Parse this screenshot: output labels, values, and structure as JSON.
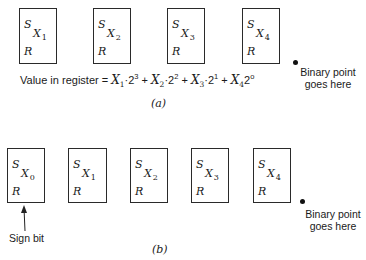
{
  "part_a": {
    "registers": [
      {
        "s": "S",
        "x": "X",
        "sub": "1",
        "r": "R"
      },
      {
        "s": "S",
        "x": "X",
        "sub": "2",
        "r": "R"
      },
      {
        "s": "S",
        "x": "X",
        "sub": "3",
        "r": "R"
      },
      {
        "s": "S",
        "x": "X",
        "sub": "4",
        "r": "R"
      }
    ],
    "equation": {
      "prefix": "Value in register = ",
      "terms": [
        {
          "var": "X",
          "sub": "1",
          "op": "·",
          "base": "2",
          "exp": "3"
        },
        {
          "var": "X",
          "sub": "2",
          "op": "·",
          "base": "2",
          "exp": "2"
        },
        {
          "var": "X",
          "sub": "3",
          "op": "·",
          "base": "2",
          "exp": "1"
        },
        {
          "var": "X",
          "sub": "4",
          "op": "",
          "base": "2",
          "exp": "o"
        }
      ],
      "plus": " + "
    },
    "binary_point_line1": "Binary point",
    "binary_point_line2": "goes here",
    "caption": "(a)"
  },
  "part_b": {
    "registers": [
      {
        "s": "S",
        "x": "X",
        "sub": "0",
        "r": "R"
      },
      {
        "s": "S",
        "x": "X",
        "sub": "1",
        "r": "R"
      },
      {
        "s": "S",
        "x": "X",
        "sub": "2",
        "r": "R"
      },
      {
        "s": "S",
        "x": "X",
        "sub": "3",
        "r": "R"
      },
      {
        "s": "S",
        "x": "X",
        "sub": "4",
        "r": "R"
      }
    ],
    "sign_bit_label": "Sign bit",
    "binary_point_line1": "Binary point",
    "binary_point_line2": "goes here",
    "caption": "(b)"
  }
}
